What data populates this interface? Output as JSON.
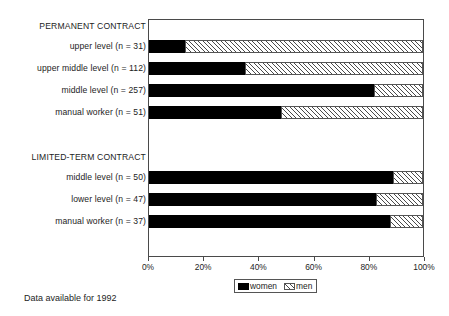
{
  "chart_data": {
    "type": "bar",
    "orientation": "horizontal",
    "stacked": true,
    "title": "",
    "xlabel": "",
    "ylabel": "",
    "xlim": [
      0,
      100
    ],
    "xticks": [
      "0%",
      "20%",
      "40%",
      "60%",
      "80%",
      "100%"
    ],
    "xtick_values": [
      0,
      20,
      40,
      60,
      80,
      100
    ],
    "grid": false,
    "legend_position": "bottom-center",
    "legend": [
      "women",
      "men"
    ],
    "series": [
      {
        "name": "women",
        "values": [
          13,
          35,
          82,
          48,
          89,
          83,
          88
        ]
      },
      {
        "name": "men",
        "values": [
          87,
          65,
          18,
          52,
          11,
          17,
          12
        ]
      }
    ],
    "categories": [
      "upper level (n = 31)",
      "upper middle level (n = 112)",
      "middle level (n = 257)",
      "manual worker (n = 51)",
      "middle level (n = 50)",
      "lower level (n = 47)",
      "manual worker (n = 37)"
    ],
    "groups": [
      {
        "label": "PERMANENT CONTRACT",
        "categories": [
          0,
          1,
          2,
          3
        ]
      },
      {
        "label": "LIMITED-TERM CONTRACT",
        "categories": [
          4,
          5,
          6
        ]
      }
    ],
    "annotations": [
      "Data available for 1992"
    ],
    "colors": {
      "women": "#000000",
      "men": "#ffffff",
      "men_hatch": "#4a4a4a",
      "axis": "#4a4a4a"
    }
  },
  "groups": {
    "permanent": {
      "label": "PERMANENT CONTRACT"
    },
    "limited": {
      "label": "LIMITED-TERM CONTRACT"
    }
  },
  "rows": [
    {
      "label": "upper level (n = 31)",
      "women": 13,
      "men": 87,
      "top": 40
    },
    {
      "label": "upper middle level (n = 112)",
      "women": 35,
      "men": 65,
      "top": 62
    },
    {
      "label": "middle level (n = 257)",
      "women": 82,
      "men": 18,
      "top": 84
    },
    {
      "label": "manual worker (n = 51)",
      "women": 48,
      "men": 52,
      "top": 106
    },
    {
      "label": "middle level (n = 50)",
      "women": 89,
      "men": 11,
      "top": 171
    },
    {
      "label": "lower level (n = 47)",
      "women": 83,
      "men": 17,
      "top": 193
    },
    {
      "label": "manual worker (n = 37)",
      "women": 88,
      "men": 12,
      "top": 215
    }
  ],
  "axis": {
    "ticks": [
      {
        "label": "0%",
        "value": 0
      },
      {
        "label": "20%",
        "value": 20
      },
      {
        "label": "40%",
        "value": 40
      },
      {
        "label": "60%",
        "value": 60
      },
      {
        "label": "80%",
        "value": 80
      },
      {
        "label": "100%",
        "value": 100
      }
    ]
  },
  "legend": {
    "women_label": "women",
    "men_label": "men"
  },
  "footnote": {
    "text": "Data available for 1992"
  }
}
